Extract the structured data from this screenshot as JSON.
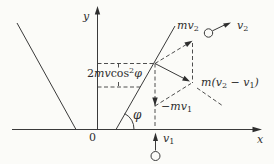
{
  "figure": {
    "axes": {
      "x_label": "x",
      "y_label": "y",
      "origin_label": "0"
    },
    "angle": {
      "phi_label": "φ"
    },
    "projection_label": {
      "coef": "2",
      "mv": "mv",
      "cos": "cos",
      "sup": "2",
      "phi": "φ"
    },
    "vectors": {
      "mv2": {
        "main": "mv",
        "sub": "2"
      },
      "v2": {
        "main": "v",
        "sub": "2"
      },
      "neg_mv1": {
        "sign": "−",
        "main": "mv",
        "sub": "1"
      },
      "v1": {
        "main": "v",
        "sub": "1"
      },
      "momentum_change": {
        "pre": "m(",
        "a": "v",
        "a_sub": "2",
        "op": " − ",
        "b": "v",
        "b_sub": "1",
        "post": ")"
      }
    },
    "colors": {
      "line": "#3a3a3a",
      "background": "#fbfbf8"
    }
  }
}
